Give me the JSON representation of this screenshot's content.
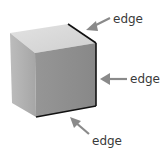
{
  "diagram": {
    "colors": {
      "top_face": "#d9d9d9",
      "left_face": "#b3b3b3",
      "front_face": "#8e8e8e",
      "edge_highlight": "#111111",
      "arrow": "#8a8a8a",
      "label": "#3a3a3a"
    },
    "labels": [
      {
        "text": "edge",
        "points_to": "top-right edge"
      },
      {
        "text": "edge",
        "points_to": "right vertical edge"
      },
      {
        "text": "edge",
        "points_to": "bottom front edge"
      }
    ]
  }
}
